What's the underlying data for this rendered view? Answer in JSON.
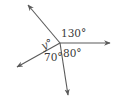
{
  "diagram": {
    "type": "angles-around-point",
    "colors": {
      "stroke": "#5a5a5a",
      "text": "#3a3a3a",
      "background": "#ffffff"
    },
    "center": {
      "x": 60,
      "y": 43
    },
    "rays": [
      {
        "name": "ray-up-left",
        "end": {
          "x": 27,
          "y": 4
        }
      },
      {
        "name": "ray-right",
        "end": {
          "x": 111,
          "y": 43
        }
      },
      {
        "name": "ray-down",
        "end": {
          "x": 68,
          "y": 96
        }
      },
      {
        "name": "ray-down-left",
        "end": {
          "x": 16,
          "y": 68
        }
      }
    ],
    "labels": {
      "angle_top_right": "130°",
      "angle_left": "y°",
      "angle_bottom_left": "70°",
      "angle_bottom_right": "80°"
    }
  }
}
